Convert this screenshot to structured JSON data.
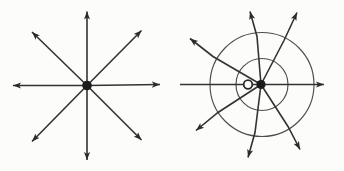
{
  "canvas": {
    "width": 344,
    "height": 171,
    "background": "#fcfcfb"
  },
  "colors": {
    "field_line": "#333333",
    "arrowhead": "#2b2b2b",
    "equipotential_circle": "#4d4d4d",
    "charge_dot": "#1b1b1b",
    "hollow_circle_stroke": "#2b2b2b",
    "hollow_circle_fill": "#fcfcfb"
  },
  "stroke_widths": {
    "field_line": 1.6,
    "equipotential_circle": 1.15,
    "hollow_circle": 1.8
  },
  "arrowhead_geometry": {
    "length": 9,
    "half_width": 3.4,
    "notch": 2.2
  },
  "figures": [
    {
      "name": "radial-field-point-charge",
      "description": "Eight straight arrows radiating symmetrically from a central filled dot",
      "center": {
        "x": 87,
        "y": 85.5
      },
      "dot_radius": 4.8,
      "circles": [],
      "hollow_circle": null,
      "lines": [
        {
          "dir": "N",
          "points": [
            [
              0,
              0
            ],
            [
              0,
              -74
            ]
          ],
          "arrow": true
        },
        {
          "dir": "NE",
          "points": [
            [
              0,
              0
            ],
            [
              54.5,
              -55
            ]
          ],
          "arrow": true
        },
        {
          "dir": "E",
          "points": [
            [
              0,
              0
            ],
            [
              73,
              -1
            ]
          ],
          "arrow": true
        },
        {
          "dir": "SE",
          "points": [
            [
              0,
              0
            ],
            [
              54.5,
              54.5
            ]
          ],
          "arrow": true
        },
        {
          "dir": "S",
          "points": [
            [
              0,
              0
            ],
            [
              0,
              74.5
            ]
          ],
          "arrow": true
        },
        {
          "dir": "SW",
          "points": [
            [
              0,
              0
            ],
            [
              -55,
              56
            ]
          ],
          "arrow": true
        },
        {
          "dir": "W",
          "points": [
            [
              0,
              0
            ],
            [
              -74,
              0
            ]
          ],
          "arrow": true
        },
        {
          "dir": "NW",
          "points": [
            [
              0,
              0
            ],
            [
              -55,
              -53.5
            ]
          ],
          "arrow": true
        }
      ]
    },
    {
      "name": "field-with-equipotential-circles",
      "description": "Filled dot with small hollow circle beside it, two concentric equipotential circles, and eight field-line arrows that bend leftward outside the circles",
      "center": {
        "x": 261,
        "y": 84.5
      },
      "dot_radius": 4.6,
      "circles": [
        {
          "dx": 1,
          "dy": 0,
          "r": 26
        },
        {
          "dx": 1,
          "dy": 0,
          "r": 52
        }
      ],
      "hollow_circle": {
        "dx": -13,
        "dy": 0,
        "r": 4.3
      },
      "lines": [
        {
          "dir": "N",
          "points": [
            [
              0,
              0
            ],
            [
              -4,
              -48
            ],
            [
              -11,
              -73
            ]
          ],
          "arrow": true
        },
        {
          "dir": "NE",
          "points": [
            [
              0,
              0
            ],
            [
              23,
              -44
            ],
            [
              36,
              -72
            ]
          ],
          "arrow": true
        },
        {
          "dir": "E",
          "points": [
            [
              0,
              0
            ],
            [
              63,
              0
            ]
          ],
          "arrow": true
        },
        {
          "dir": "SE",
          "points": [
            [
              0,
              0
            ],
            [
              27,
              42
            ],
            [
              39,
              65
            ]
          ],
          "arrow": true
        },
        {
          "dir": "S",
          "points": [
            [
              0,
              0
            ],
            [
              -6,
              48
            ],
            [
              -13,
              73
            ]
          ],
          "arrow": true
        },
        {
          "dir": "SW",
          "points": [
            [
              0,
              0
            ],
            [
              -43,
              28
            ],
            [
              -65,
              46
            ]
          ],
          "arrow": true
        },
        {
          "dir": "W",
          "points": [
            [
              0,
              0
            ],
            [
              -81,
              0
            ]
          ],
          "arrow": false
        },
        {
          "dir": "NW",
          "points": [
            [
              0,
              0
            ],
            [
              -48,
              -28
            ],
            [
              -71,
              -46
            ]
          ],
          "arrow": true
        }
      ]
    }
  ]
}
